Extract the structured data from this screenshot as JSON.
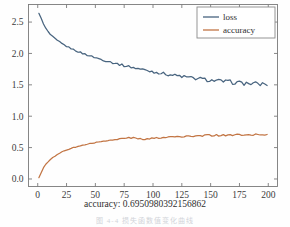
{
  "figure": {
    "background_color": "#fefefe",
    "frame_color": "#7a7a7a"
  },
  "legend": {
    "position": "upper-right",
    "border_color": "#8a8a8a",
    "entries": [
      {
        "label": "loss",
        "color": "#48647f"
      },
      {
        "label": "accuracy",
        "color": "#c27544"
      }
    ]
  },
  "axis": {
    "xlabel": "accuracy:  0.6950980392156862",
    "ylabel": "",
    "x_ticks": [
      "0",
      "25",
      "50",
      "75",
      "100",
      "125",
      "150",
      "175",
      "200"
    ],
    "y_ticks": [
      "0.0",
      "0.5",
      "1.0",
      "1.5",
      "2.0",
      "2.5"
    ]
  },
  "caption": {
    "text": "图 4-4  损失函数值变化曲线"
  },
  "chart_data": {
    "type": "line",
    "title": "",
    "xlabel": "accuracy:  0.6950980392156862",
    "ylabel": "",
    "xlim": [
      -8,
      208
    ],
    "ylim": [
      -0.12,
      2.78
    ],
    "grid": false,
    "legend_position": "upper right",
    "x_ticks": [
      0,
      25,
      50,
      75,
      100,
      125,
      150,
      175,
      200
    ],
    "y_ticks": [
      0.0,
      0.5,
      1.0,
      1.5,
      2.0,
      2.5
    ],
    "final_accuracy": 0.6950980392156862,
    "series": [
      {
        "name": "loss",
        "color": "#48647f",
        "x": [
          1,
          3,
          5,
          7,
          9,
          11,
          13,
          15,
          17,
          19,
          21,
          23,
          25,
          27,
          29,
          31,
          33,
          35,
          37,
          39,
          41,
          43,
          45,
          47,
          49,
          51,
          53,
          55,
          57,
          59,
          61,
          63,
          65,
          67,
          69,
          71,
          73,
          75,
          77,
          79,
          81,
          83,
          85,
          87,
          89,
          91,
          93,
          95,
          97,
          99,
          101,
          103,
          105,
          107,
          109,
          111,
          113,
          115,
          117,
          119,
          121,
          123,
          125,
          127,
          129,
          131,
          133,
          135,
          137,
          139,
          141,
          143,
          145,
          147,
          149,
          151,
          153,
          155,
          157,
          159,
          161,
          163,
          165,
          167,
          169,
          171,
          173,
          175,
          177,
          179,
          181,
          183,
          185,
          187,
          189,
          191,
          193,
          195,
          197,
          199
        ],
        "y": [
          2.64,
          2.56,
          2.47,
          2.4,
          2.345,
          2.3,
          2.265,
          2.235,
          2.205,
          2.18,
          2.155,
          2.135,
          2.115,
          2.095,
          2.08,
          2.06,
          2.045,
          2.03,
          2.015,
          2.0,
          1.99,
          1.975,
          1.965,
          1.95,
          1.94,
          1.93,
          1.915,
          1.905,
          1.895,
          1.885,
          1.875,
          1.865,
          1.855,
          1.845,
          1.835,
          1.825,
          1.815,
          1.805,
          1.8,
          1.79,
          1.785,
          1.775,
          1.765,
          1.76,
          1.75,
          1.745,
          1.735,
          1.73,
          1.72,
          1.715,
          1.705,
          1.7,
          1.695,
          1.685,
          1.68,
          1.675,
          1.665,
          1.66,
          1.655,
          1.65,
          1.645,
          1.64,
          1.635,
          1.63,
          1.62,
          1.615,
          1.61,
          1.605,
          1.6,
          1.6,
          1.595,
          1.59,
          1.585,
          1.58,
          1.575,
          1.57,
          1.57,
          1.565,
          1.56,
          1.555,
          1.555,
          1.55,
          1.545,
          1.545,
          1.54,
          1.54,
          1.535,
          1.53,
          1.53,
          1.525,
          1.525,
          1.52,
          1.52,
          1.515,
          1.515,
          1.515,
          1.51,
          1.51,
          1.51,
          1.51
        ]
      },
      {
        "name": "accuracy",
        "color": "#c27544",
        "x": [
          1,
          3,
          5,
          7,
          9,
          11,
          13,
          15,
          17,
          19,
          21,
          23,
          25,
          27,
          29,
          31,
          33,
          35,
          37,
          39,
          41,
          43,
          45,
          47,
          49,
          51,
          53,
          55,
          57,
          59,
          61,
          63,
          65,
          67,
          69,
          71,
          73,
          75,
          77,
          79,
          81,
          83,
          85,
          87,
          89,
          91,
          93,
          95,
          97,
          99,
          101,
          103,
          105,
          107,
          109,
          111,
          113,
          115,
          117,
          119,
          121,
          123,
          125,
          127,
          129,
          131,
          133,
          135,
          137,
          139,
          141,
          143,
          145,
          147,
          149,
          151,
          153,
          155,
          157,
          159,
          161,
          163,
          165,
          167,
          169,
          171,
          173,
          175,
          177,
          179,
          181,
          183,
          185,
          187,
          189,
          191,
          193,
          195,
          197,
          199
        ],
        "y": [
          0.02,
          0.1,
          0.18,
          0.235,
          0.275,
          0.31,
          0.34,
          0.365,
          0.39,
          0.41,
          0.43,
          0.445,
          0.46,
          0.475,
          0.49,
          0.5,
          0.51,
          0.52,
          0.53,
          0.54,
          0.545,
          0.555,
          0.56,
          0.57,
          0.575,
          0.585,
          0.59,
          0.595,
          0.6,
          0.605,
          0.61,
          0.615,
          0.62,
          0.625,
          0.63,
          0.635,
          0.64,
          0.645,
          0.65,
          0.655,
          0.655,
          0.655,
          0.65,
          0.645,
          0.64,
          0.635,
          0.635,
          0.64,
          0.645,
          0.65,
          0.65,
          0.655,
          0.655,
          0.66,
          0.66,
          0.665,
          0.665,
          0.67,
          0.67,
          0.67,
          0.675,
          0.675,
          0.675,
          0.68,
          0.68,
          0.685,
          0.685,
          0.685,
          0.69,
          0.69,
          0.69,
          0.69,
          0.695,
          0.695,
          0.695,
          0.695,
          0.695,
          0.695,
          0.695,
          0.7,
          0.7,
          0.7,
          0.7,
          0.7,
          0.7,
          0.7,
          0.7,
          0.7,
          0.7,
          0.7,
          0.7,
          0.705,
          0.7,
          0.7,
          0.705,
          0.7,
          0.705,
          0.705,
          0.705,
          0.705
        ]
      }
    ]
  }
}
